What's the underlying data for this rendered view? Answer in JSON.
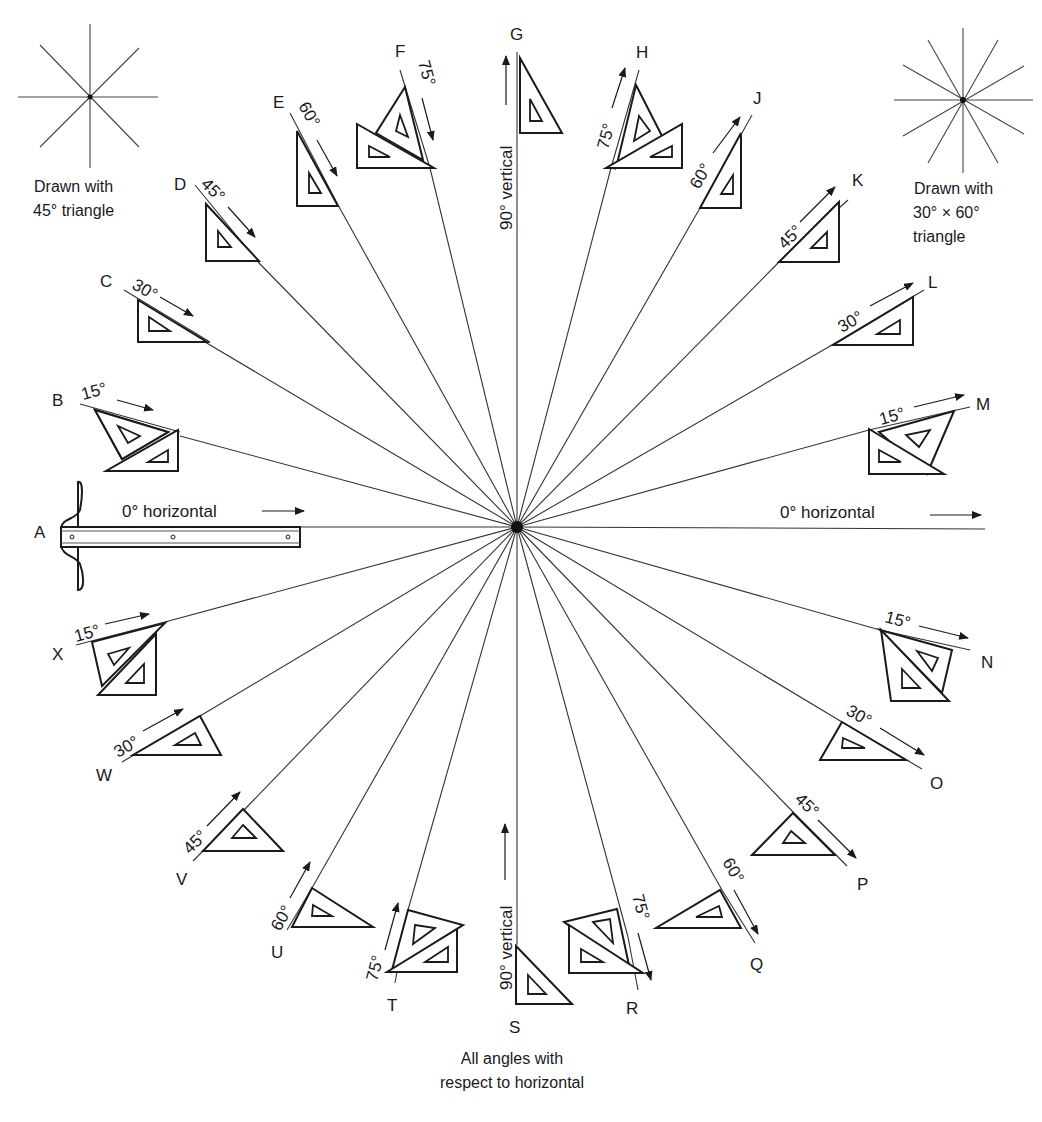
{
  "center": {
    "x": 517,
    "y": 527
  },
  "caption_bottom": [
    "All angles with",
    "respect to horizontal"
  ],
  "legend_left": {
    "lines": [
      "Drawn with",
      "45° triangle"
    ],
    "star_angles": [
      0,
      45,
      90,
      135
    ]
  },
  "legend_right": {
    "lines": [
      "Drawn with",
      "30° × 60°",
      "triangle"
    ],
    "star_angles": [
      0,
      30,
      60,
      90,
      120,
      150
    ]
  },
  "horizontal_left_label": "0° horizontal",
  "horizontal_right_label": "0° horizontal",
  "vertical_top_label": "90° vertical",
  "vertical_bottom_label": "90° vertical",
  "tool_a": "T-square",
  "rays": [
    {
      "letter": "A",
      "angle_deg": 180,
      "label": "0°",
      "tool": "T-square"
    },
    {
      "letter": "B",
      "angle_deg": 165,
      "label": "15°",
      "tool": "45° + 30×60 triangles"
    },
    {
      "letter": "C",
      "angle_deg": 150,
      "label": "30°",
      "tool": "30×60 triangle"
    },
    {
      "letter": "D",
      "angle_deg": 135,
      "label": "45°",
      "tool": "45° triangle"
    },
    {
      "letter": "E",
      "angle_deg": 120,
      "label": "60°",
      "tool": "30×60 triangle"
    },
    {
      "letter": "F",
      "angle_deg": 105,
      "label": "75°",
      "tool": "45° + 30×60 triangles"
    },
    {
      "letter": "G",
      "angle_deg": 90,
      "label": "90° vertical",
      "tool": "30×60 triangle"
    },
    {
      "letter": "H",
      "angle_deg": 75,
      "label": "75°",
      "tool": "45° + 30×60 triangles"
    },
    {
      "letter": "J",
      "angle_deg": 60,
      "label": "60°",
      "tool": "30×60 triangle"
    },
    {
      "letter": "K",
      "angle_deg": 45,
      "label": "45°",
      "tool": "45° triangle"
    },
    {
      "letter": "L",
      "angle_deg": 30,
      "label": "30°",
      "tool": "30×60 triangle"
    },
    {
      "letter": "M",
      "angle_deg": 15,
      "label": "15°",
      "tool": "45° + 30×60 triangles"
    },
    {
      "letter": "N",
      "angle_deg": -15,
      "label": "15°",
      "tool": "45° + 30×60 triangles"
    },
    {
      "letter": "O",
      "angle_deg": -30,
      "label": "30°",
      "tool": "30×60 triangle"
    },
    {
      "letter": "P",
      "angle_deg": -45,
      "label": "45°",
      "tool": "45° triangle"
    },
    {
      "letter": "Q",
      "angle_deg": -60,
      "label": "60°",
      "tool": "30×60 triangle"
    },
    {
      "letter": "R",
      "angle_deg": -75,
      "label": "75°",
      "tool": "45° + 30×60 triangles"
    },
    {
      "letter": "S",
      "angle_deg": -90,
      "label": "90° vertical",
      "tool": "30×60 triangle"
    },
    {
      "letter": "T",
      "angle_deg": -105,
      "label": "75°",
      "tool": "45° + 30×60 triangles"
    },
    {
      "letter": "U",
      "angle_deg": -120,
      "label": "60°",
      "tool": "30×60 triangle"
    },
    {
      "letter": "V",
      "angle_deg": -135,
      "label": "45°",
      "tool": "45° triangle"
    },
    {
      "letter": "W",
      "angle_deg": -150,
      "label": "30°",
      "tool": "30×60 triangle"
    },
    {
      "letter": "X",
      "angle_deg": -165,
      "label": "15°",
      "tool": "45° + 30×60 triangles"
    }
  ],
  "letters": {
    "A": "A",
    "B": "B",
    "C": "C",
    "D": "D",
    "E": "E",
    "F": "F",
    "G": "G",
    "H": "H",
    "J": "J",
    "K": "K",
    "L": "L",
    "M": "M",
    "N": "N",
    "O": "O",
    "P": "P",
    "Q": "Q",
    "R": "R",
    "S": "S",
    "T": "T",
    "U": "U",
    "V": "V",
    "W": "W",
    "X": "X"
  },
  "degrees": {
    "d15": "15°",
    "d30": "30°",
    "d45": "45°",
    "d60": "60°",
    "d75": "75°"
  }
}
